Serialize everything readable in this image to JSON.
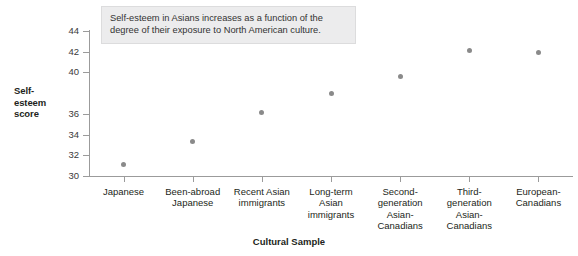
{
  "chart_data": {
    "type": "scatter",
    "title": "",
    "xlabel": "Cultural Sample",
    "ylabel": "Self-esteem score",
    "ylim": [
      30,
      44
    ],
    "yticks": [
      30,
      32,
      34,
      36,
      40,
      42,
      44
    ],
    "ytick_labels": [
      "30",
      "32",
      "34",
      "36",
      "40",
      "42",
      "44"
    ],
    "grid": false,
    "legend": false,
    "categories": [
      "Japanese",
      "Been-abroad Japanese",
      "Recent Asian immigrants",
      "Long-term Asian immigrants",
      "Second-generation Asian-Canadians",
      "Third-generation Asian-Canadians",
      "European-Canadians"
    ],
    "category_lines": [
      [
        "Japanese"
      ],
      [
        "Been-abroad",
        "Japanese"
      ],
      [
        "Recent Asian",
        "immigrants"
      ],
      [
        "Long-term",
        "Asian",
        "immigrants"
      ],
      [
        "Second-",
        "generation",
        "Asian-",
        "Canadians"
      ],
      [
        "Third-",
        "generation",
        "Asian-",
        "Canadians"
      ],
      [
        "European-",
        "Canadians"
      ]
    ],
    "values": [
      31.1,
      33.3,
      36.1,
      38.0,
      39.6,
      42.1,
      41.9
    ],
    "annotation": {
      "lines": [
        "Self-esteem in Asians increases as a function of the",
        "degree of their exposure to North American culture."
      ]
    },
    "colors": {
      "point": "#8a8a8a",
      "axis": "#9b9b9b",
      "text": "#231f20",
      "annotation_background": "#ececed",
      "annotation_border": "#dcdcdd",
      "background": "#ffffff"
    }
  },
  "y_axis_title_lines": [
    "Self-",
    "esteem",
    "score"
  ]
}
